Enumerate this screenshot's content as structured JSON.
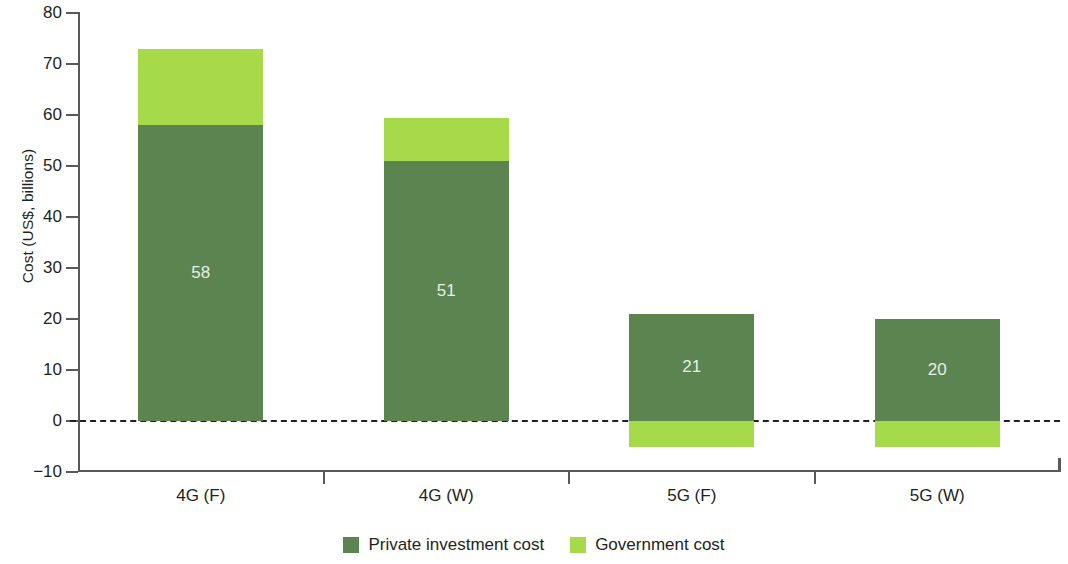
{
  "chart_data": {
    "type": "bar",
    "stacked": true,
    "title": "",
    "xlabel": "",
    "ylabel": "Cost (US$, billions)",
    "categories": [
      "4G (F)",
      "4G (W)",
      "5G (F)",
      "5G (W)"
    ],
    "series": [
      {
        "name": "Private investment cost",
        "color": "#5b8450",
        "values": [
          58,
          51,
          21,
          20
        ],
        "data_labels": [
          "58",
          "51",
          "21",
          "20"
        ]
      },
      {
        "name": "Government cost",
        "color": "#a7da4b",
        "values": [
          15,
          8.5,
          -5,
          -5
        ],
        "data_labels": [
          "",
          "",
          "",
          ""
        ]
      }
    ],
    "totals_positive": [
      73,
      59.5,
      21,
      20
    ],
    "ylim": [
      -10,
      80
    ],
    "yticks": [
      80,
      70,
      60,
      50,
      40,
      30,
      20,
      10,
      0,
      -10
    ],
    "ytick_labels": [
      "80",
      "70",
      "60",
      "50",
      "40",
      "30",
      "20",
      "10",
      "0",
      "−10"
    ],
    "grid": false,
    "zero_line": "dashed",
    "legend_position": "bottom-center"
  },
  "axis": {
    "y_title": "Cost (US$, billions)"
  },
  "legend": {
    "items": [
      {
        "label": "Private investment cost",
        "color": "#5b8450"
      },
      {
        "label": "Government cost",
        "color": "#a7da4b"
      }
    ]
  },
  "colors": {
    "private": "#5b8450",
    "government": "#a7da4b",
    "axis": "#58595b",
    "text": "#231f20",
    "value_label": "#e9eee7",
    "background": "#ffffff"
  }
}
